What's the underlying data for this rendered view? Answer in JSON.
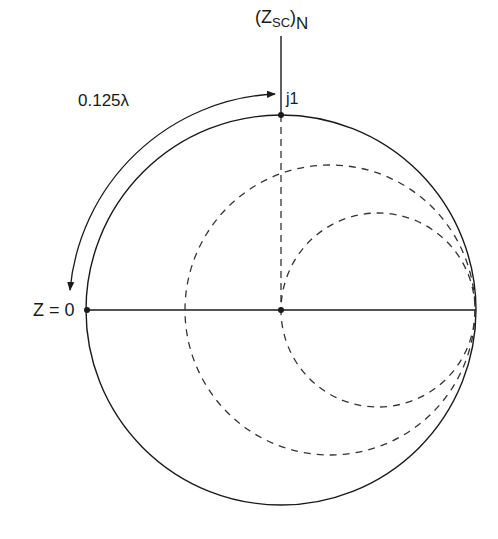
{
  "diagram": {
    "type": "smith-chart",
    "labels": {
      "top_label_main": "(Z",
      "top_label_sub": "SC",
      "top_label_close": ")",
      "top_label_n": "N",
      "j1": "j1",
      "arc_length": "0.125λ",
      "z_zero": "Z = 0"
    },
    "colors": {
      "line": "#1a1a1a",
      "dashed": "#333333",
      "background": "#ffffff"
    },
    "geometry": {
      "outer_circle": {
        "cx": 281,
        "cy": 310,
        "r": 195
      },
      "middle_dashed_circle": {
        "cx": 330,
        "cy": 310,
        "r": 145
      },
      "inner_dashed_circle": {
        "cx": 378,
        "cy": 310,
        "r": 97
      },
      "rotation_arc_radius": 216
    },
    "points": [
      {
        "name": "short-circuit",
        "label": "Z = 0",
        "x": 86,
        "y": 310
      },
      {
        "name": "center",
        "x": 281,
        "y": 310
      },
      {
        "name": "j1-point",
        "label": "j1",
        "x": 281,
        "y": 115
      }
    ],
    "arrow": {
      "description": "bidirectional rotation arc along outer circle",
      "label": "0.125λ"
    }
  }
}
